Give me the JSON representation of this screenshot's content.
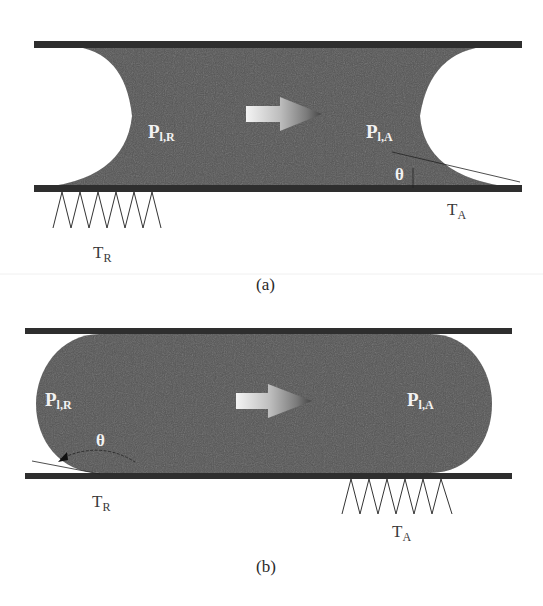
{
  "colors": {
    "liquid": "#555555",
    "plate": "#2e2e2e",
    "background": "#ffffff",
    "label_on_liquid": "#f2f2f2",
    "label_text": "#3a3a3a"
  },
  "panel_a": {
    "caption": "(a)",
    "receding_pressure": {
      "main": "P",
      "sub": "l,R"
    },
    "advancing_pressure": {
      "main": "P",
      "sub": "l,A"
    },
    "contact_angle": "θ",
    "receding_temperature": {
      "main": "T",
      "sub": "R"
    },
    "advancing_temperature": {
      "main": "T",
      "sub": "A"
    },
    "flow_arrow": "arrow-right-icon",
    "heater": "zigzag-heater-icon"
  },
  "panel_b": {
    "caption": "(b)",
    "receding_pressure": {
      "main": "P",
      "sub": "l,R"
    },
    "advancing_pressure": {
      "main": "P",
      "sub": "l,A"
    },
    "contact_angle": "θ",
    "receding_temperature": {
      "main": "T",
      "sub": "R"
    },
    "advancing_temperature": {
      "main": "T",
      "sub": "A"
    },
    "flow_arrow": "arrow-right-icon",
    "heater": "zigzag-heater-icon"
  }
}
